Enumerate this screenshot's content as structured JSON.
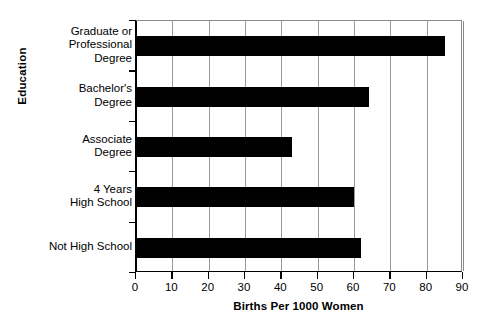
{
  "chart_data": {
    "type": "bar",
    "orientation": "horizontal",
    "title": "",
    "xlabel": "Births Per 1000 Women",
    "ylabel": "Education",
    "categories": [
      "Graduate or Professional Degree",
      "Bachelor's Degree",
      "Associate Degree",
      "4 Years High School",
      "Not High School"
    ],
    "category_lines": [
      [
        "Graduate or",
        "Professional",
        "Degree"
      ],
      [
        "Bachelor's",
        "Degree"
      ],
      [
        "Associate",
        "Degree"
      ],
      [
        "4 Years",
        "High School"
      ],
      [
        "Not High School"
      ]
    ],
    "values": [
      85,
      64,
      43,
      60,
      62
    ],
    "xlim": [
      0,
      90
    ],
    "xticks": [
      0,
      10,
      20,
      30,
      40,
      50,
      60,
      70,
      80,
      90
    ],
    "grid": true,
    "grid_axis": "x",
    "legend": "none",
    "bar_color": "#000000",
    "grid_color": "#9a9a9a",
    "axis_color": "#000000",
    "background_color": "#ffffff"
  }
}
